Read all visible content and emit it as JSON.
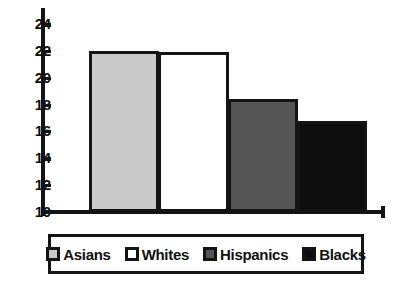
{
  "chart_data": {
    "type": "bar",
    "title": "",
    "subtitle": "",
    "xlabel": "",
    "ylabel": "",
    "categories": [
      "Asians",
      "Whites",
      "Hispanics",
      "Blacks"
    ],
    "values": [
      22.0,
      21.9,
      18.4,
      16.8
    ],
    "series": [
      {
        "name": "",
        "values": [
          22.0,
          21.9,
          18.4,
          16.8
        ]
      }
    ],
    "ylim": [
      10,
      25
    ],
    "yticks": [
      10,
      12,
      14,
      16,
      18,
      20,
      22,
      24
    ],
    "ytick_labels": [
      "10",
      "12",
      "14",
      "16",
      "18",
      "20",
      "22",
      "24"
    ],
    "xticks": [],
    "xtick_labels": [],
    "grid": false,
    "legend_position": "bottom",
    "bar_colors": [
      "#c9c9c9",
      "#ffffff",
      "#555555",
      "#0d0d0d"
    ],
    "bar_edge_color": "#141414",
    "axis_color": "#141414",
    "text_color": "#111111",
    "background": "#ffffff"
  },
  "legend": {
    "items": [
      {
        "label": "Asians",
        "color": "#c9c9c9"
      },
      {
        "label": "Whites",
        "color": "#ffffff"
      },
      {
        "label": "Hispanics",
        "color": "#555555"
      },
      {
        "label": "Blacks",
        "color": "#0d0d0d"
      }
    ]
  }
}
